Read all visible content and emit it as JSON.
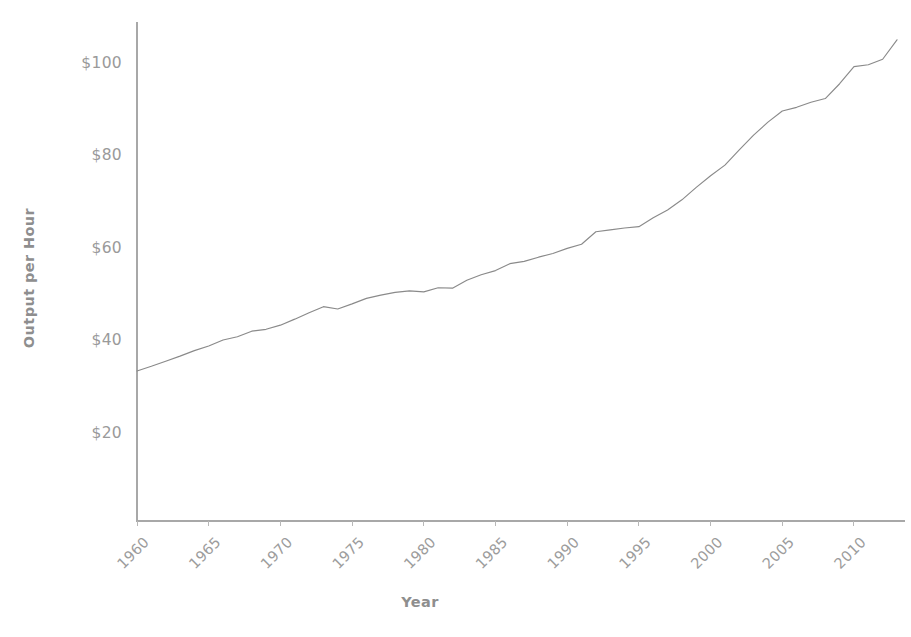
{
  "chart_data": {
    "type": "line",
    "title": "",
    "subtitle": "",
    "xlabel": "Year",
    "ylabel": "Output per Hour",
    "grid": false,
    "legend": "none",
    "xlim": [
      1960,
      2013
    ],
    "ylim": [
      10,
      110
    ],
    "xtick_labels": [
      "1960",
      "1965",
      "1970",
      "1975",
      "1980",
      "1985",
      "1990",
      "1995",
      "2000",
      "2005",
      "2010"
    ],
    "xticks": [
      1960,
      1965,
      1970,
      1975,
      1980,
      1985,
      1990,
      1995,
      2000,
      2005,
      2010
    ],
    "ytick_labels": [
      "$20",
      "$40",
      "$60",
      "$80",
      "$100"
    ],
    "yticks": [
      20,
      40,
      60,
      80,
      100
    ],
    "value_prefix": "$",
    "series": [
      {
        "name": "Output per Hour",
        "color": "#8a8a8a",
        "x": [
          1960,
          1961,
          1962,
          1963,
          1964,
          1965,
          1966,
          1967,
          1968,
          1969,
          1970,
          1971,
          1972,
          1973,
          1974,
          1975,
          1976,
          1977,
          1978,
          1979,
          1980,
          1981,
          1982,
          1983,
          1984,
          1985,
          1986,
          1987,
          1988,
          1989,
          1990,
          1991,
          1992,
          1993,
          1994,
          1995,
          1996,
          1997,
          1998,
          1999,
          2000,
          2001,
          2002,
          2003,
          2004,
          2005,
          2006,
          2007,
          2008,
          2009,
          2010,
          2011,
          2012,
          2013
        ],
        "values": [
          33.2,
          34.2,
          35.3,
          36.4,
          37.6,
          38.6,
          39.9,
          40.6,
          41.8,
          42.2,
          43.1,
          44.4,
          45.8,
          47.1,
          46.6,
          47.7,
          48.9,
          49.6,
          50.2,
          50.5,
          50.3,
          51.2,
          51.1,
          52.8,
          54.0,
          54.9,
          56.4,
          56.9,
          57.8,
          58.6,
          59.7,
          60.6,
          63.3,
          63.7,
          64.1,
          64.4,
          66.3,
          68.0,
          70.2,
          72.9,
          75.4,
          77.7,
          81.0,
          84.2,
          87.0,
          89.4,
          90.2,
          91.3,
          92.1,
          95.3,
          99.0,
          99.4,
          100.6,
          104.8
        ]
      }
    ]
  },
  "axis_titles": {
    "x": "Year",
    "y": "Output per Hour"
  }
}
